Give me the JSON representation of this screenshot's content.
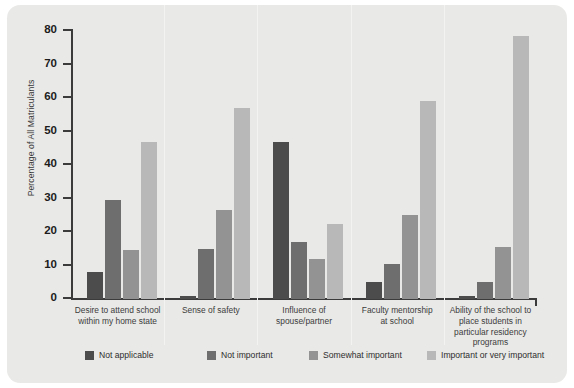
{
  "chart_data": {
    "type": "bar",
    "title": "",
    "subtitle": "",
    "xlabel": "",
    "ylabel": "Percentage of All Matriculants",
    "ylim": [
      0,
      80
    ],
    "yticks": [
      0,
      10,
      20,
      30,
      40,
      50,
      60,
      70,
      80
    ],
    "grid": false,
    "legend_position": "bottom",
    "categories": [
      "Desire to attend school within my home state",
      "Sense of safety",
      "Influence of spouse/partner",
      "Faculty mentorship at school",
      "Ability of the school to place students in particular residency programs"
    ],
    "category_lines": [
      [
        "Desire to attend school",
        "within my home state"
      ],
      [
        "Sense of safety"
      ],
      [
        "Influence of",
        "spouse/partner"
      ],
      [
        "Faculty mentorship",
        "at school"
      ],
      [
        "Ability of the school to",
        "place students in",
        "particular residency",
        "programs"
      ]
    ],
    "series": [
      {
        "name": "Not applicable",
        "color": "#4c4c4c",
        "values": [
          8,
          1,
          47,
          5,
          1
        ]
      },
      {
        "name": "Not important",
        "color": "#6e6e6e",
        "values": [
          29.5,
          15,
          17,
          10.5,
          5
        ]
      },
      {
        "name": "Somewhat important",
        "color": "#939393",
        "values": [
          14.5,
          26.5,
          12,
          25,
          15.5
        ]
      },
      {
        "name": "Important or very important",
        "color": "#b8b8b8",
        "values": [
          47,
          57,
          22.5,
          59,
          78.5
        ]
      }
    ]
  },
  "figure": {
    "background_color": "#e9e9e7",
    "axis_color": "#3b3b3b"
  }
}
